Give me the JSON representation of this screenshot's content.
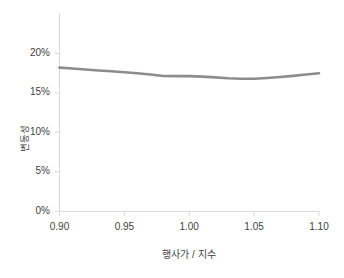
{
  "chart_data": {
    "type": "line",
    "title": "",
    "subtitle": "",
    "xlabel": "행사가 / 지수",
    "ylabel": "변동성",
    "grid": false,
    "legend": null,
    "legend_position": "none",
    "line_color": "#8c8c8c",
    "axis_color": "#d9d9d9",
    "tick_label_color": "#3f3f3f",
    "xlim": [
      0.9,
      1.1
    ],
    "ylim": [
      0.0,
      0.25
    ],
    "yticks": [
      0,
      0.05,
      0.1,
      0.15,
      0.2
    ],
    "ytick_labels": [
      "0%",
      "5%",
      "10%",
      "15%",
      "20%"
    ],
    "xticks": [
      0.9,
      0.95,
      1.0,
      1.05,
      1.1
    ],
    "xtick_labels": [
      "0.90",
      "0.95",
      "1.00",
      "1.05",
      "1.10"
    ],
    "x": [
      0.9,
      0.91,
      0.92,
      0.93,
      0.94,
      0.95,
      0.96,
      0.97,
      0.98,
      0.99,
      1.0,
      1.01,
      1.02,
      1.03,
      1.04,
      1.05,
      1.06,
      1.07,
      1.08,
      1.09,
      1.1
    ],
    "values": [
      0.182,
      0.1808,
      0.1796,
      0.1784,
      0.1773,
      0.1762,
      0.1748,
      0.1732,
      0.1714,
      0.1712,
      0.1712,
      0.1706,
      0.1696,
      0.1685,
      0.1678,
      0.1679,
      0.1688,
      0.17,
      0.1715,
      0.1732,
      0.1748
    ],
    "series": [
      {
        "name": "변동성",
        "color": "#8c8c8c",
        "values": [
          0.182,
          0.1808,
          0.1796,
          0.1784,
          0.1773,
          0.1762,
          0.1748,
          0.1732,
          0.1714,
          0.1712,
          0.1712,
          0.1706,
          0.1696,
          0.1685,
          0.1678,
          0.1679,
          0.1688,
          0.17,
          0.1715,
          0.1732,
          0.1748
        ]
      }
    ]
  },
  "axes": {
    "y_tick_labels": [
      "20%",
      "15%",
      "10%",
      "5%",
      "0%"
    ],
    "x_tick_labels": [
      "0.90",
      "0.95",
      "1.00",
      "1.05",
      "1.10"
    ],
    "y_axis_title": "변동성",
    "x_axis_title": "행사가 / 지수"
  }
}
